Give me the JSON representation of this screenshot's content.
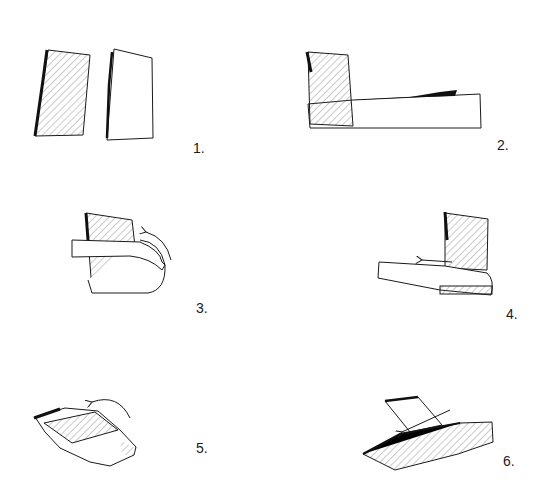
{
  "diagram": {
    "type": "folding-instructions",
    "steps": [
      {
        "number": 1,
        "label": "1.",
        "description": "Two paper strips side by side: one hatched, one plain"
      },
      {
        "number": 2,
        "label": "2.",
        "description": "Hatched strip placed upright over left end of plain horizontal strip"
      },
      {
        "number": 3,
        "label": "3.",
        "description": "Plain strip folded up and over the hatched strip, curved arrow shows direction"
      },
      {
        "number": 4,
        "label": "4.",
        "description": "Strip pulled left across hatched strip, straight arrow pointing left"
      },
      {
        "number": 5,
        "label": "5.",
        "description": "Assembly rotated, curved arrow indicating fold over"
      },
      {
        "number": 6,
        "label": "6.",
        "description": "Final folded piece with arrow pointing left"
      }
    ]
  },
  "colors": {
    "ink": "#1a1a1a",
    "background": "#ffffff",
    "hatch": "#555555"
  }
}
